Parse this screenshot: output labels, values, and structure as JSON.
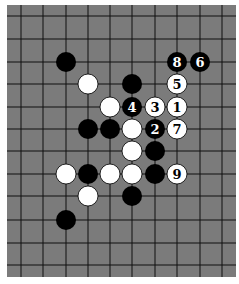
{
  "diagram": {
    "type": "go-board-diagram",
    "board": {
      "left": 7,
      "top": 5,
      "right": 236,
      "bottom": 277,
      "background": "#7b7b7b",
      "line_color": "#111111",
      "cols_x": [
        21,
        43,
        66,
        88,
        110,
        132,
        155,
        177,
        200,
        222
      ],
      "rows_y": [
        16,
        39,
        62,
        84,
        107,
        129,
        151,
        174,
        196,
        220,
        243,
        265
      ],
      "stone_radius": 10
    },
    "colors": {
      "black": "#000000",
      "white": "#ffffff",
      "black_label": "#ffffff",
      "white_label": "#000000"
    },
    "stones": [
      {
        "color": "black",
        "col": 2,
        "row": 2,
        "label": ""
      },
      {
        "color": "black",
        "col": 7,
        "row": 2,
        "label": "8"
      },
      {
        "color": "black",
        "col": 8,
        "row": 2,
        "label": "6"
      },
      {
        "color": "white",
        "col": 3,
        "row": 3,
        "label": ""
      },
      {
        "color": "black",
        "col": 5,
        "row": 3,
        "label": ""
      },
      {
        "color": "white",
        "col": 7,
        "row": 3,
        "label": "5"
      },
      {
        "color": "white",
        "col": 4,
        "row": 4,
        "label": ""
      },
      {
        "color": "black",
        "col": 5,
        "row": 4,
        "label": "4"
      },
      {
        "color": "white",
        "col": 6,
        "row": 4,
        "label": "3"
      },
      {
        "color": "white",
        "col": 7,
        "row": 4,
        "label": "1"
      },
      {
        "color": "black",
        "col": 3,
        "row": 5,
        "label": ""
      },
      {
        "color": "black",
        "col": 4,
        "row": 5,
        "label": ""
      },
      {
        "color": "white",
        "col": 5,
        "row": 5,
        "label": ""
      },
      {
        "color": "black",
        "col": 6,
        "row": 5,
        "label": "2"
      },
      {
        "color": "white",
        "col": 7,
        "row": 5,
        "label": "7"
      },
      {
        "color": "white",
        "col": 5,
        "row": 6,
        "label": ""
      },
      {
        "color": "black",
        "col": 6,
        "row": 6,
        "label": ""
      },
      {
        "color": "white",
        "col": 2,
        "row": 7,
        "label": ""
      },
      {
        "color": "black",
        "col": 3,
        "row": 7,
        "label": ""
      },
      {
        "color": "white",
        "col": 4,
        "row": 7,
        "label": ""
      },
      {
        "color": "white",
        "col": 5,
        "row": 7,
        "label": ""
      },
      {
        "color": "black",
        "col": 6,
        "row": 7,
        "label": ""
      },
      {
        "color": "white",
        "col": 7,
        "row": 7,
        "label": "9"
      },
      {
        "color": "white",
        "col": 3,
        "row": 8,
        "label": ""
      },
      {
        "color": "black",
        "col": 5,
        "row": 8,
        "label": ""
      },
      {
        "color": "black",
        "col": 2,
        "row": 9,
        "label": ""
      }
    ]
  }
}
